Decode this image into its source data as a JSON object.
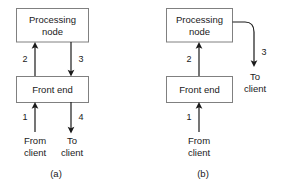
{
  "figure": {
    "background_color": "#ffffff",
    "line_color": "#1a1a1a",
    "box_border_color": "#808080",
    "box_fill_color": "#ffffff"
  },
  "panels": [
    {
      "id": "a",
      "caption": "(a)",
      "boxes": [
        {
          "name": "processing-node",
          "line1": "Processing",
          "line2": "node"
        },
        {
          "name": "front-end",
          "line1": "Front end",
          "line2": ""
        }
      ],
      "flows": [
        {
          "number": "1",
          "from": "client",
          "to": "front end",
          "direction": "up"
        },
        {
          "number": "2",
          "from": "front end",
          "to": "processing node",
          "direction": "up"
        },
        {
          "number": "3",
          "from": "processing node",
          "to": "front end",
          "direction": "down"
        },
        {
          "number": "4",
          "from": "front end",
          "to": "client",
          "direction": "down"
        }
      ],
      "endpoints": [
        {
          "name": "from-client",
          "line1": "From",
          "line2": "client"
        },
        {
          "name": "to-client",
          "line1": "To",
          "line2": "client"
        }
      ]
    },
    {
      "id": "b",
      "caption": "(b)",
      "boxes": [
        {
          "name": "processing-node",
          "line1": "Processing",
          "line2": "node"
        },
        {
          "name": "front-end",
          "line1": "Front end",
          "line2": ""
        }
      ],
      "flows": [
        {
          "number": "1",
          "from": "client",
          "to": "front end",
          "direction": "up"
        },
        {
          "number": "2",
          "from": "front end",
          "to": "processing node",
          "direction": "up"
        },
        {
          "number": "3",
          "from": "processing node",
          "to": "client",
          "direction": "curved-down"
        }
      ],
      "endpoints": [
        {
          "name": "from-client",
          "line1": "From",
          "line2": "client"
        },
        {
          "name": "to-client",
          "line1": "To",
          "line2": "client"
        }
      ]
    }
  ]
}
